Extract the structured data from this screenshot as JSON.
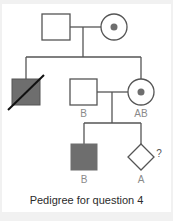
{
  "figure": {
    "caption": "Pedigree for question 4",
    "colors": {
      "line": "#555555",
      "affected_fill": "#6e6e6e",
      "carrier_dot": "#6e6e6e",
      "label": "#8a8a8a",
      "background": "#ffffff"
    },
    "legend_symbols": {
      "square": "male",
      "circle": "female",
      "diamond": "sex unspecified",
      "filled": "affected",
      "dot": "carrier",
      "slash": "deceased"
    }
  },
  "pedigree": {
    "generation_1": [
      {
        "id": "I-1",
        "sex": "male",
        "affected": false,
        "label": ""
      },
      {
        "id": "I-2",
        "sex": "female",
        "carrier": true,
        "label": ""
      }
    ],
    "generation_2": [
      {
        "id": "II-1",
        "sex": "male",
        "affected": true,
        "deceased": true,
        "label": ""
      },
      {
        "id": "II-2",
        "sex": "male",
        "affected": false,
        "label": "B",
        "note": "spouse"
      },
      {
        "id": "II-3",
        "sex": "female",
        "carrier": true,
        "label": "AB"
      }
    ],
    "generation_3": [
      {
        "id": "III-1",
        "sex": "male",
        "affected": true,
        "label": "B"
      },
      {
        "id": "III-2",
        "sex": "unknown",
        "affected": false,
        "label": "A",
        "query": "?"
      }
    ]
  }
}
